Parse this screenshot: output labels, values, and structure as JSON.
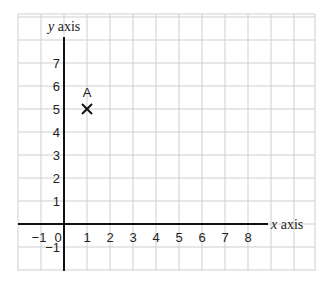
{
  "chart_data": {
    "type": "scatter",
    "title": "",
    "xlabel": "x axis",
    "ylabel": "y axis",
    "x_ticks": [
      "-1",
      "0",
      "1",
      "2",
      "3",
      "4",
      "5",
      "6",
      "7",
      "8"
    ],
    "y_ticks": [
      "-1",
      "1",
      "2",
      "3",
      "4",
      "5",
      "6",
      "7"
    ],
    "xlim": [
      -2,
      11
    ],
    "ylim": [
      -2,
      9
    ],
    "grid": true,
    "points": [
      {
        "label": "A",
        "x": 1,
        "y": 5,
        "marker": "x"
      }
    ]
  },
  "labels": {
    "x_axis_var": "x",
    "x_axis_word": " axis",
    "y_axis_var": "y",
    "y_axis_word": " axis",
    "point_a": "A",
    "origin": "0"
  },
  "colors": {
    "grid": "#cfcfcf",
    "axis": "#111111"
  }
}
